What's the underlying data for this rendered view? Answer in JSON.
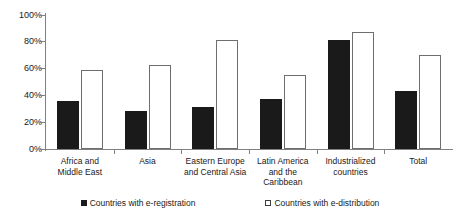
{
  "chart_data": {
    "type": "bar",
    "title": "",
    "subtitle": "",
    "xlabel": "",
    "ylabel": "",
    "ylim": [
      0,
      100
    ],
    "yticks": [
      0,
      20,
      40,
      60,
      80,
      100
    ],
    "ytick_labels": [
      "0%",
      "20%",
      "40%",
      "60%",
      "80%",
      "100%"
    ],
    "grid": false,
    "legend_position": "bottom",
    "value_unit": "%",
    "categories": [
      "Africa and\nMiddle East",
      "Asia",
      "Eastern Europe\nand Central Asia",
      "Latin America\nand the\nCaribbean",
      "Industrialized\ncountries",
      "Total"
    ],
    "category_lines": [
      [
        "Africa and",
        "Middle East"
      ],
      [
        "Asia"
      ],
      [
        "Eastern Europe",
        "and Central Asia"
      ],
      [
        "Latin America",
        "and the",
        "Caribbean"
      ],
      [
        "Industrialized",
        "countries"
      ],
      [
        "Total"
      ]
    ],
    "series": [
      {
        "name": "Countries with e-registration",
        "marker": "filled-square",
        "color": "#1a1a1a",
        "values": [
          36,
          28,
          31,
          37,
          81,
          43
        ]
      },
      {
        "name": "Countries with e-distribution",
        "marker": "hollow-square",
        "color": "#ffffff",
        "values": [
          59,
          63,
          81,
          55,
          87,
          70
        ]
      }
    ]
  },
  "legend": {
    "entries": [
      {
        "label": "Countries with e-registration",
        "swatch": "filled-square"
      },
      {
        "label": "Countries with e-distribution",
        "swatch": "hollow-square"
      }
    ]
  },
  "axis": {
    "y_labels": [
      "100%",
      "80%",
      "60%",
      "40%",
      "20%",
      "0%"
    ]
  }
}
